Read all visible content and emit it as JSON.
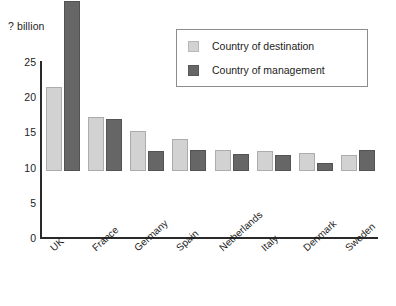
{
  "chart_data": {
    "type": "bar",
    "title": "",
    "subtitle": "",
    "xlabel": "",
    "ylabel": "? billion",
    "ylim": [
      0,
      25
    ],
    "yticks": [
      0,
      5,
      10,
      15,
      20,
      25
    ],
    "ytick_labels": [
      "0",
      "5",
      "10",
      "15",
      "20",
      "25"
    ],
    "grid": false,
    "legend_position": "top-right",
    "categories": [
      "UK",
      "France",
      "Germany",
      "Spain",
      "Netherlands",
      "Italy",
      "Denmark",
      "Sweden"
    ],
    "series": [
      {
        "name": "Country of destination",
        "color": "#d2d2d2",
        "values": [
          12.0,
          7.7,
          5.7,
          4.5,
          3.0,
          2.8,
          2.5,
          2.3
        ]
      },
      {
        "name": "Country of management",
        "color": "#666666",
        "values": [
          24.2,
          7.4,
          2.9,
          3.0,
          2.4,
          2.3,
          1.1,
          3.0
        ]
      }
    ]
  },
  "legend": {
    "items": [
      {
        "label": "Country of destination"
      },
      {
        "label": "Country of management"
      }
    ]
  },
  "axis": {
    "y_title": "? billion"
  }
}
